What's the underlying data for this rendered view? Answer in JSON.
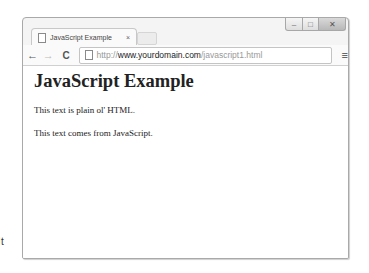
{
  "window": {
    "controls": {
      "minimize": "–",
      "maximize": "□",
      "close": "✕"
    }
  },
  "tabs": [
    {
      "title": "JavaScript Example",
      "close": "×",
      "active": true
    }
  ],
  "toolbar": {
    "back": "←",
    "forward": "→",
    "reload": "C",
    "url": {
      "scheme": "http://",
      "host": "www.yourdomain.com",
      "path": "/javascript1.html"
    },
    "menu": "≡"
  },
  "page": {
    "heading": "JavaScript Example",
    "paragraphs": [
      "This text is plain ol' HTML.",
      "This text comes from JavaScript."
    ]
  },
  "stray_text": "t"
}
